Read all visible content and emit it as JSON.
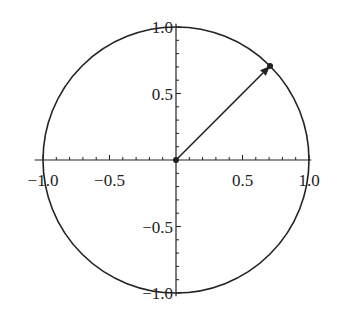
{
  "chart_data": {
    "type": "line",
    "title": "",
    "xlabel": "",
    "ylabel": "",
    "xlim": [
      -1.1,
      1.1
    ],
    "ylim": [
      -1.1,
      1.1
    ],
    "grid": false,
    "legend": null,
    "series": [
      {
        "name": "unit circle",
        "kind": "parametric",
        "x": "cos(t)",
        "y": "sin(t)",
        "t_range": [
          0,
          6.2832
        ],
        "radius": 1.0
      },
      {
        "name": "vector",
        "kind": "arrow",
        "from": [
          0,
          0
        ],
        "to": [
          0.707,
          0.707
        ],
        "angle_deg": 45
      }
    ],
    "points": [
      {
        "name": "origin",
        "x": 0,
        "y": 0
      },
      {
        "name": "endpoint",
        "x": 0.707,
        "y": 0.707
      }
    ],
    "x_ticks": {
      "major": [
        -1.0,
        -0.5,
        0.5,
        1.0
      ],
      "labels": [
        "−1.0",
        "−0.5",
        "0.5",
        "1.0"
      ],
      "minor_step": 0.1
    },
    "y_ticks": {
      "major": [
        -1.0,
        -0.5,
        0.5,
        1.0
      ],
      "labels": [
        "−1.0",
        "−0.5",
        "0.5",
        "1.0"
      ],
      "minor_step": 0.1
    }
  },
  "layout": {
    "center_px": [
      176,
      160
    ],
    "scale_px": 133,
    "line_color": "#222222"
  }
}
